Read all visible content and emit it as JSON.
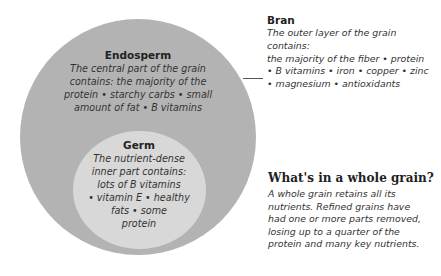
{
  "colors": {
    "outer_layer": "#b3b3b3",
    "inner_layer": "#d8d8d8",
    "connector": "#555555"
  },
  "endosperm": {
    "title": "Endosperm",
    "lines": [
      "The central part of the grain",
      "contains: the majority of the",
      "protein • starchy carbs • small",
      "amount of fat • B vitamins"
    ]
  },
  "germ": {
    "title": "Germ",
    "lines": [
      "The nutrient-dense",
      "inner part contains:",
      "lots of B vitamins",
      "• vitamin E • healthy",
      "fats • some",
      "protein"
    ]
  },
  "bran": {
    "title": "Bran",
    "lines": [
      "The outer layer of the grain contains:",
      "the majority of the fiber • protein",
      "• B vitamins • iron • copper • zinc",
      "• magnesium • antioxidants"
    ]
  },
  "info": {
    "title": "What's in a whole grain?",
    "lines": [
      "A whole grain retains all its",
      "nutrients. Refined grains have",
      "had one or more parts removed,",
      "losing up to a quarter of the",
      "protein and many key nutrients."
    ]
  }
}
